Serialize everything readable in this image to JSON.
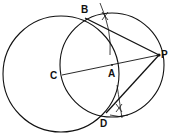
{
  "diagram": {
    "labels": {
      "B": "B",
      "C": "C",
      "A": "A",
      "P": "P",
      "D": "D"
    },
    "stroke_color": "#111111",
    "background": "#ffffff"
  }
}
